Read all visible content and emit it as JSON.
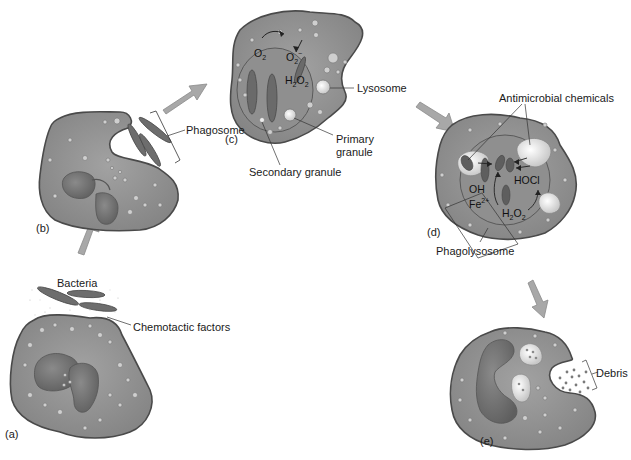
{
  "diagram": {
    "title": "",
    "type": "phagocytosis-process",
    "colors": {
      "cell_fill": "#8c8c8c",
      "cell_edge": "#4a4a4a",
      "nucleus_fill": "#6e6e6e",
      "vesicle_fill": "#e6e6e6",
      "arrow_fill": "#a6a6a6",
      "bacteria_fill": "#6a6a6a"
    },
    "panels": [
      {
        "id": "a",
        "label": "(a)"
      },
      {
        "id": "b",
        "label": "(b)"
      },
      {
        "id": "c",
        "label": "(c)"
      },
      {
        "id": "d",
        "label": "(d)"
      },
      {
        "id": "e",
        "label": "(e)"
      }
    ],
    "labels": {
      "bacteria": "Bacteria",
      "chemotactic_factors": "Chemotactic factors",
      "phagosome": "Phagosome",
      "lysosome": "Lysosome",
      "primary_granule_line1": "Primary",
      "primary_granule_line2": "granule",
      "secondary_granule": "Secondary granule",
      "antimicrobial_chemicals": "Antimicrobial chemicals",
      "phagolysosome": "Phagolysosome",
      "debris": "Debris"
    },
    "chemistry": {
      "c_o2": "O",
      "c_o2_sub": "2",
      "c_superoxide": "O",
      "c_superoxide_sub": "2",
      "c_superoxide_sup": "−",
      "c_h2o2_a": "H",
      "c_h2o2_sub1": "2",
      "c_h2o2_b": "O",
      "c_h2o2_sub2": "2",
      "d_oh": "OH",
      "d_fe": "Fe",
      "d_fe_sup": "2+",
      "d_hocl": "HOCl",
      "d_h2o2_a": "H",
      "d_h2o2_sub1": "2",
      "d_h2o2_b": "O",
      "d_h2o2_sub2": "2"
    }
  }
}
